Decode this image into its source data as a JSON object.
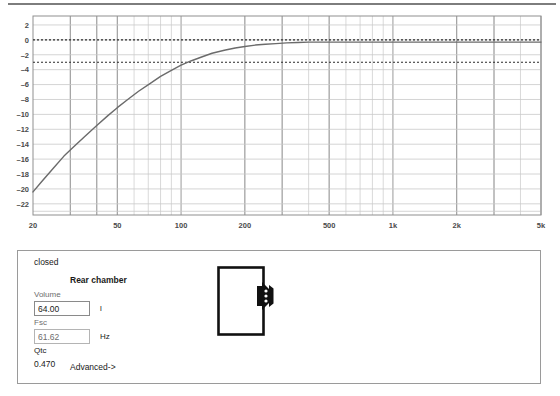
{
  "chart_data": {
    "type": "line",
    "title": "",
    "xlabel": "",
    "ylabel": "",
    "xscale": "log",
    "xlim": [
      20,
      5000
    ],
    "ylim": [
      -23.5,
      3.2
    ],
    "grid": true,
    "legend": null,
    "x_tick_labels": [
      "20",
      "50",
      "100",
      "200",
      "500",
      "1k",
      "2k",
      "5k"
    ],
    "x_tick_values": [
      20,
      50,
      100,
      200,
      500,
      1000,
      2000,
      5000
    ],
    "y_tick_labels": [
      "2",
      "0",
      "-2",
      "-4",
      "-6",
      "-8",
      "-10",
      "-12",
      "-14",
      "-16",
      "-18",
      "-20",
      "-22"
    ],
    "y_tick_values": [
      2,
      0,
      -2,
      -4,
      -6,
      -8,
      -10,
      -12,
      -14,
      -16,
      -18,
      -20,
      -22
    ],
    "reference_lines": [
      {
        "name": "0 dB reference",
        "value": 0,
        "style": "dotted"
      },
      {
        "name": "-3 dB reference",
        "value": -3,
        "style": "dotted"
      }
    ],
    "series": [
      {
        "name": "Closed box response",
        "color": "#6b6b6b",
        "x": [
          20,
          22,
          25,
          28,
          31.5,
          35,
          40,
          45,
          50,
          56,
          63,
          71,
          80,
          90,
          100,
          112,
          125,
          140,
          160,
          180,
          200,
          224,
          250,
          280,
          315,
          355,
          400,
          450,
          500,
          560,
          630,
          710,
          800,
          900,
          1000,
          1250,
          1600,
          2000,
          2500,
          3150,
          4000,
          5000
        ],
        "y": [
          -20.4,
          -19.0,
          -17.2,
          -15.6,
          -14.2,
          -13.0,
          -11.5,
          -10.2,
          -9.1,
          -8.0,
          -6.9,
          -5.9,
          -4.9,
          -4.1,
          -3.4,
          -2.8,
          -2.3,
          -1.8,
          -1.4,
          -1.1,
          -0.9,
          -0.7,
          -0.6,
          -0.5,
          -0.4,
          -0.35,
          -0.3,
          -0.3,
          -0.3,
          -0.3,
          -0.3,
          -0.3,
          -0.3,
          -0.3,
          -0.3,
          -0.3,
          -0.3,
          -0.3,
          -0.3,
          -0.3,
          -0.3,
          -0.3
        ]
      }
    ]
  },
  "panel": {
    "alignment_label": "closed",
    "section_title": "Rear chamber",
    "fields": [
      {
        "label": "Volume",
        "value": "64.00",
        "unit": "l",
        "readonly": false
      },
      {
        "label": "Fsc",
        "value": "61.62",
        "unit": "Hz",
        "readonly": true
      }
    ],
    "qtc": {
      "label": "Qtc",
      "value": "0.470"
    },
    "advanced_label": "Advanced->",
    "diagram_name": "closed-box-enclosure"
  },
  "colors": {
    "curve": "#6b6b6b",
    "grid_major": "#8f8f8f",
    "grid_minor": "#c9c9c9",
    "axis": "#7a7a7a",
    "panel_border": "#9a9a9a"
  }
}
